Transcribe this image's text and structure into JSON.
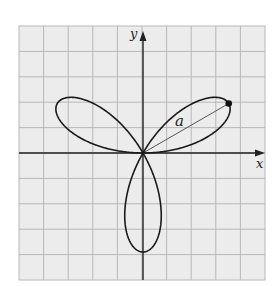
{
  "figure": {
    "type": "polar-rose",
    "axis_labels": {
      "x": "x",
      "y": "y"
    },
    "radius_label": "a",
    "colors": {
      "grid": "#b8b8b8",
      "grid_background": "#ececec",
      "axes": "#222222",
      "curve": "#1a1a1a",
      "radius_line": "#555555"
    },
    "grid": {
      "columns": 10,
      "rows": 10
    },
    "curve": {
      "equation": "r = a sin 3θ",
      "petals": 3,
      "petal_angles_deg": [
        30,
        150,
        270
      ]
    },
    "marked_point": {
      "angle_deg": 30,
      "r": "a"
    }
  }
}
